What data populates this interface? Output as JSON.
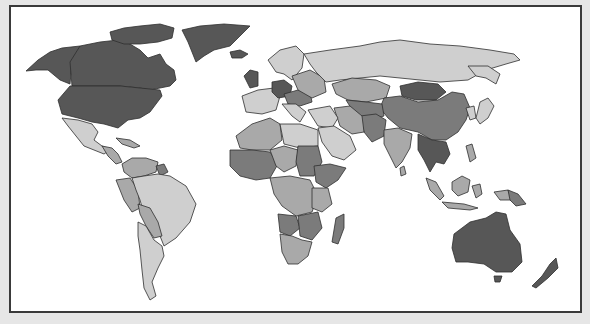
{
  "map": {
    "type": "choropleth-world-map",
    "style": "grayscale",
    "legend_visible": false,
    "title_visible": false,
    "colors": {
      "background": "#e6e6e6",
      "panel": "#ffffff",
      "border": "#3a3a3a",
      "outline": "#2e2e2e",
      "shade_1_darkest": "#575757",
      "shade_2_dark": "#7b7b7b",
      "shade_3_medium": "#a9a9a9",
      "shade_4_light": "#cfcfcf"
    },
    "regions": [
      {
        "name": "Canada",
        "shade": 1
      },
      {
        "name": "United States",
        "shade": 1
      },
      {
        "name": "Alaska",
        "shade": 1
      },
      {
        "name": "Greenland",
        "shade": 1
      },
      {
        "name": "Mexico",
        "shade": 4
      },
      {
        "name": "Central America",
        "shade": 3
      },
      {
        "name": "Caribbean",
        "shade": 3
      },
      {
        "name": "Brazil",
        "shade": 4
      },
      {
        "name": "Argentina",
        "shade": 4
      },
      {
        "name": "Chile",
        "shade": 4
      },
      {
        "name": "Peru",
        "shade": 3
      },
      {
        "name": "Bolivia",
        "shade": 3
      },
      {
        "name": "Colombia",
        "shade": 3
      },
      {
        "name": "Venezuela",
        "shade": 3
      },
      {
        "name": "Guyana",
        "shade": 2
      },
      {
        "name": "Paraguay",
        "shade": 3
      },
      {
        "name": "Western Europe",
        "shade": 4
      },
      {
        "name": "Germany",
        "shade": 1
      },
      {
        "name": "Central Europe",
        "shade": 2
      },
      {
        "name": "Scandinavia",
        "shade": 4
      },
      {
        "name": "Iceland",
        "shade": 1
      },
      {
        "name": "Ireland",
        "shade": 1
      },
      {
        "name": "Russia",
        "shade": 4
      },
      {
        "name": "Kazakhstan",
        "shade": 3
      },
      {
        "name": "Mongolia",
        "shade": 1
      },
      {
        "name": "China",
        "shade": 2
      },
      {
        "name": "India",
        "shade": 3
      },
      {
        "name": "Afghanistan/Pakistan",
        "shade": 2
      },
      {
        "name": "Iran",
        "shade": 3
      },
      {
        "name": "Middle East",
        "shade": 4
      },
      {
        "name": "Arabian Peninsula",
        "shade": 4
      },
      {
        "name": "Southeast Asia",
        "shade": 1
      },
      {
        "name": "Japan",
        "shade": 4
      },
      {
        "name": "Korea",
        "shade": 4
      },
      {
        "name": "Indonesia",
        "shade": 3
      },
      {
        "name": "Papua New Guinea",
        "shade": 2
      },
      {
        "name": "Philippines",
        "shade": 3
      },
      {
        "name": "North Africa",
        "shade": 3
      },
      {
        "name": "Libya/Egypt",
        "shade": 4
      },
      {
        "name": "West Africa",
        "shade": 2
      },
      {
        "name": "Sudan",
        "shade": 2
      },
      {
        "name": "Ethiopia",
        "shade": 2
      },
      {
        "name": "Central Africa",
        "shade": 3
      },
      {
        "name": "Angola",
        "shade": 2
      },
      {
        "name": "Southern Africa",
        "shade": 3
      },
      {
        "name": "Madagascar",
        "shade": 2
      },
      {
        "name": "Australia",
        "shade": 1
      },
      {
        "name": "New Zealand",
        "shade": 1
      },
      {
        "name": "Sri Lanka",
        "shade": 3
      }
    ]
  }
}
